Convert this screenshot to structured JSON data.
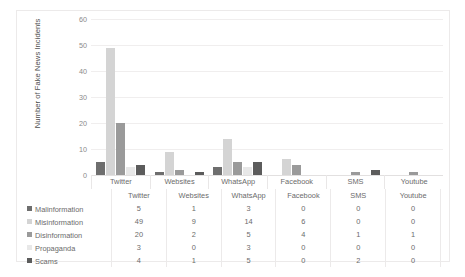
{
  "chart_data": {
    "type": "bar",
    "title": "",
    "xlabel": "",
    "ylabel": "Number of Fake News Incidents",
    "ylim": [
      0,
      60
    ],
    "yticks": [
      60,
      50,
      40,
      30,
      20,
      10,
      0
    ],
    "grid": true,
    "legend_position": "table-below",
    "categories": [
      "Twitter",
      "Websites",
      "WhatsApp",
      "Facebook",
      "SMS",
      "Youtube"
    ],
    "series": [
      {
        "name": "Malinformation",
        "color": "#6e6e6e",
        "values": [
          5,
          1,
          3,
          0,
          0,
          0
        ]
      },
      {
        "name": "Misinformation",
        "color": "#d4d4d4",
        "values": [
          49,
          9,
          14,
          6,
          0,
          0
        ]
      },
      {
        "name": "Disinformation",
        "color": "#9a9a9a",
        "values": [
          20,
          2,
          5,
          4,
          1,
          1
        ]
      },
      {
        "name": "Propaganda",
        "color": "#e8e8e8",
        "values": [
          3,
          0,
          3,
          0,
          0,
          0
        ]
      },
      {
        "name": "Scams",
        "color": "#5c5c5c",
        "values": [
          4,
          1,
          5,
          0,
          2,
          0
        ]
      }
    ]
  },
  "table": {
    "header_blank": "",
    "columns": [
      "Twitter",
      "Websites",
      "WhatsApp",
      "Facebook",
      "SMS",
      "Youtube"
    ],
    "rows": [
      {
        "label": "Malinformation",
        "color": "#6e6e6e",
        "cells": [
          "5",
          "1",
          "3",
          "0",
          "0",
          "0"
        ]
      },
      {
        "label": "Misinformation",
        "color": "#d4d4d4",
        "cells": [
          "49",
          "9",
          "14",
          "6",
          "0",
          "0"
        ]
      },
      {
        "label": "Disinformation",
        "color": "#9a9a9a",
        "cells": [
          "20",
          "2",
          "5",
          "4",
          "1",
          "1"
        ]
      },
      {
        "label": "Propaganda",
        "color": "#e8e8e8",
        "cells": [
          "3",
          "0",
          "3",
          "0",
          "0",
          "0"
        ]
      },
      {
        "label": "Scams",
        "color": "#5c5c5c",
        "cells": [
          "4",
          "1",
          "5",
          "0",
          "2",
          "0"
        ]
      }
    ]
  }
}
